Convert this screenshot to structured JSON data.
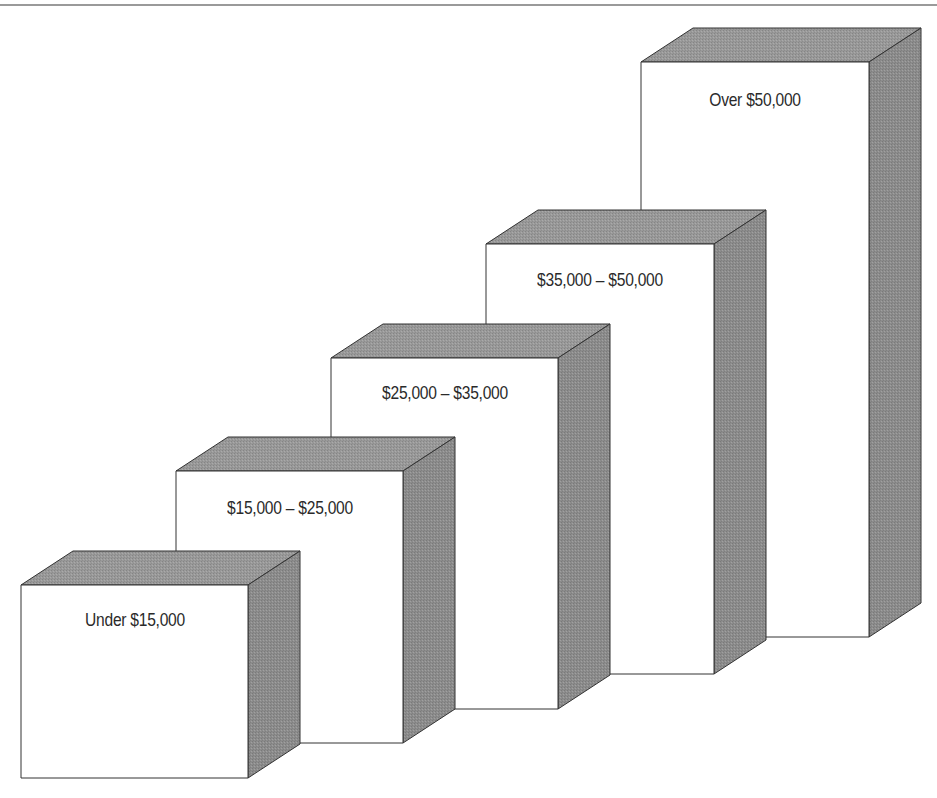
{
  "diagram": {
    "type": "3d-staircase-blocks",
    "colors": {
      "front": "#ffffff",
      "side": "#8c8c8c",
      "top": "#999999",
      "edge": "#333333",
      "frame_line": "#9a9a9a"
    },
    "depth": {
      "dx": 52,
      "dy": -34
    },
    "blocks": [
      {
        "label": "Under $15,000",
        "front": {
          "left": 21,
          "top": 585,
          "right": 248,
          "bottom": 778
        },
        "label_y": 620
      },
      {
        "label": "$15,000 – $25,000",
        "front": {
          "left": 176,
          "top": 471,
          "right": 403,
          "bottom": 743
        },
        "label_y": 508
      },
      {
        "label": "$25,000 – $35,000",
        "front": {
          "left": 331,
          "top": 358,
          "right": 558,
          "bottom": 709
        },
        "label_y": 393
      },
      {
        "label": "$35,000 – $50,000",
        "front": {
          "left": 486,
          "top": 244,
          "right": 714,
          "bottom": 674
        },
        "label_y": 280
      },
      {
        "label": "Over $50,000",
        "front": {
          "left": 641,
          "top": 62,
          "right": 869,
          "bottom": 637
        },
        "label_y": 100
      }
    ]
  }
}
